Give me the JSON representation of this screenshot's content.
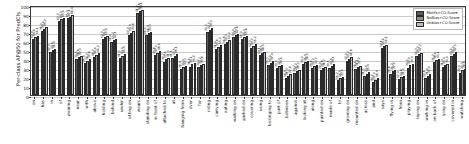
{
  "chart_data": {
    "type": "bar",
    "title": "",
    "xlabel": "",
    "ylabel": "Per-class AP@50 for PredCls",
    "ylim": [
      0,
      100
    ],
    "yticks": [
      0,
      10,
      20,
      30,
      40,
      50,
      60,
      70,
      80,
      90,
      100
    ],
    "grid": true,
    "legend_position": "upper right",
    "categories": [
      "on",
      "has",
      "in",
      "of",
      "wearing",
      "near",
      "with",
      "above",
      "holding",
      "behind",
      "under",
      "sitting on",
      "wears",
      "standing on",
      "in front of",
      "attached to",
      "at",
      "hanging from",
      "over",
      "for",
      "riding",
      "carrying",
      "eating",
      "walking on",
      "parked on",
      "covering",
      "using",
      "belonging to",
      "part of",
      "between",
      "against",
      "looking at",
      "along",
      "painted on",
      "made of",
      "to",
      "growing on",
      "mounted on",
      "across",
      "and",
      "says",
      "flying in",
      "from",
      "playing",
      "laying on",
      "walking in",
      "on back of",
      "lying on",
      "covered in",
      "watching"
    ],
    "series": [
      {
        "name": "Motifs+CO-Score",
        "color": "#5c5c5c",
        "values": [
          62.4,
          71.0,
          47.3,
          82.2,
          85.3,
          39.5,
          35.9,
          41.7,
          62.0,
          58.4,
          41.5,
          67.0,
          91.2,
          66.5,
          44.8,
          37.2,
          41.1,
          28.4,
          31.6,
          30.7,
          70.2,
          51.4,
          56.8,
          64.0,
          61.9,
          52.3,
          44.1,
          33.5,
          29.6,
          18.9,
          24.2,
          34.0,
          29.8,
          27.4,
          30.1,
          16.2,
          37.9,
          28.6,
          21.5,
          14.7,
          52.1,
          23.8,
          17.4,
          30.5,
          43.3,
          19.1,
          36.2,
          31.0,
          43.6,
          24.9
        ]
      },
      {
        "name": "NoBias+CO-Score",
        "color": "#8f8f8f",
        "values": [
          64.8,
          73.6,
          49.8,
          84.0,
          87.1,
          41.8,
          38.2,
          44.6,
          64.3,
          60.7,
          43.9,
          69.4,
          92.8,
          68.9,
          47.0,
          39.6,
          43.5,
          30.9,
          34.1,
          33.2,
          72.5,
          53.8,
          59.3,
          66.4,
          64.2,
          54.7,
          46.5,
          35.9,
          32.0,
          21.3,
          26.7,
          36.4,
          32.2,
          29.8,
          32.6,
          18.5,
          40.2,
          31.1,
          23.9,
          17.0,
          54.6,
          26.2,
          19.8,
          32.9,
          45.7,
          21.4,
          38.6,
          33.4,
          46.0,
          27.3
        ]
      },
      {
        "name": "Unbias+CO-Score",
        "color": "#bdbdbd",
        "values": [
          66.1,
          75.2,
          51.4,
          85.6,
          88.4,
          43.3,
          39.8,
          46.2,
          65.9,
          62.1,
          45.4,
          70.8,
          94.1,
          70.3,
          48.6,
          41.0,
          45.1,
          32.3,
          35.7,
          34.8,
          74.0,
          55.2,
          60.9,
          67.8,
          65.8,
          56.2,
          48.0,
          37.4,
          33.6,
          22.8,
          28.2,
          38.0,
          33.7,
          31.2,
          34.1,
          20.0,
          41.8,
          32.7,
          25.4,
          18.4,
          56.1,
          27.7,
          21.2,
          34.4,
          47.2,
          22.9,
          40.1,
          34.9,
          47.5,
          28.8
        ]
      }
    ]
  }
}
